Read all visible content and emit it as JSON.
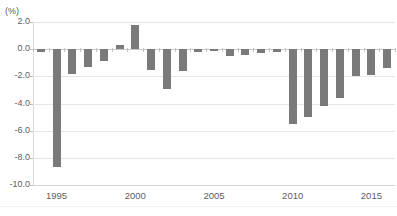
{
  "chart_data": {
    "type": "bar",
    "title": "",
    "unit_label": "(%)",
    "xlabel": "",
    "ylabel": "",
    "ylim": [
      -10.0,
      2.0
    ],
    "ytick_values": [
      2.0,
      0.0,
      -2.0,
      -4.0,
      -6.0,
      -8.0,
      -10.0
    ],
    "ytick_labels": [
      "2.0",
      "0.0",
      "-2.0",
      "-4.0",
      "-6.0",
      "-8.0",
      "-10.0"
    ],
    "xtick_labels": [
      "1995",
      "2000",
      "2005",
      "2010",
      "2015"
    ],
    "xtick_categories": [
      1995,
      2000,
      2005,
      2010,
      2015
    ],
    "grid": true,
    "legend": "none",
    "bar_color": "#7a7a7a",
    "gridline_color": "#e6e6e6",
    "axis_color": "#d9d9d9",
    "text_color": "#5e5e5e",
    "categories": [
      1994,
      1995,
      1996,
      1997,
      1998,
      1999,
      2000,
      2001,
      2002,
      2003,
      2004,
      2005,
      2006,
      2007,
      2008,
      2009,
      2010,
      2011,
      2012,
      2013,
      2014,
      2015,
      2016
    ],
    "values": [
      -0.2,
      -8.7,
      -1.8,
      -1.3,
      -0.9,
      0.3,
      1.8,
      -1.5,
      -2.9,
      -1.6,
      -0.2,
      -0.1,
      -0.5,
      -0.4,
      -0.3,
      -0.2,
      -5.5,
      -5.0,
      -4.2,
      -3.6,
      -2.0,
      -1.9,
      -1.4
    ]
  }
}
